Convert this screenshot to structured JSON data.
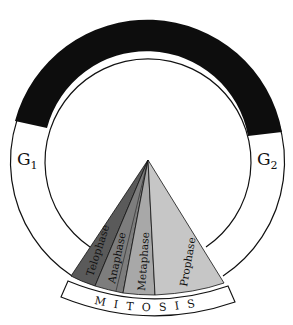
{
  "diagram": {
    "ring_labels": {
      "g1": {
        "main": "G",
        "sub": "1"
      },
      "g2": {
        "main": "G",
        "sub": "2"
      }
    },
    "mitosis_label": "MITOSIS",
    "phases": [
      {
        "name": "Telophase",
        "color": "#5a5a5a"
      },
      {
        "name": "Anaphase",
        "color": "#7d7d7d"
      },
      {
        "name": "Metaphase",
        "color": "#a8a8a8"
      },
      {
        "name": "Prophase",
        "color": "#c6c6c6"
      }
    ],
    "colors": {
      "synthesis_band": "#0d0d0d",
      "outline": "#111111",
      "background": "#ffffff"
    }
  }
}
